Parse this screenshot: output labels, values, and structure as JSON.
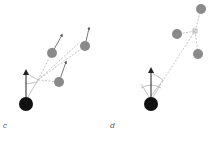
{
  "panels": [
    {
      "label": "c",
      "description": "agent with heading arrow, averaging direction toward three moving neighbors"
    },
    {
      "label": "d",
      "description": "agent with field of view turning toward centroid of three neighbors"
    }
  ],
  "colors": {
    "agent": "#111111",
    "neighbor": "#8a8a8a",
    "dashed": "#b0b0b0",
    "arrow": "#333333"
  }
}
